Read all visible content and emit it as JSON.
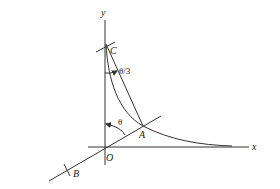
{
  "figure": {
    "colors": {
      "stroke": "#333333",
      "text": "#222222",
      "background": "#ffffff"
    },
    "labels": {
      "y_axis": "y",
      "x_axis": "x",
      "origin": "O",
      "point_a": "A",
      "point_b": "B",
      "point_c": "C",
      "angle_theta": "θ",
      "angle_theta_third": "θ/3"
    }
  }
}
